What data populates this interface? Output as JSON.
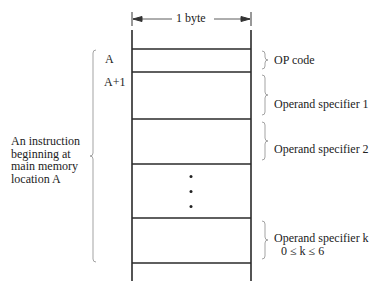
{
  "diagram": {
    "width_label": "1 byte",
    "address_labels": [
      {
        "text": "A"
      },
      {
        "text": "A+1"
      }
    ],
    "description": "An instruction\nbeginning at\nmain memory\nlocation A",
    "fields": [
      {
        "label": "OP code"
      },
      {
        "label": "Operand specifier 1"
      },
      {
        "label": "Operand specifier 2"
      },
      {
        "label": "Operand specifier k"
      }
    ],
    "k_constraint": "0 ≤ k ≤ 6",
    "ellipsis": "vertical-dots"
  }
}
